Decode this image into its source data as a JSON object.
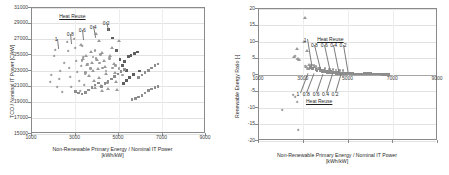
{
  "figure": {
    "panels": [
      "left",
      "right"
    ]
  },
  "chart_data": [
    {
      "id": "tco-chart",
      "type": "scatter",
      "title": "",
      "xlabel": "Non-Renewable Primary Energy / Nominal IT Power [kWh/kW]",
      "xlabel_line1": "Non-Renewable Primary Energy / Nominal IT Power",
      "xlabel_line2": "[kWh/kW]",
      "ylabel": "TCO / Nominal IT Power [C/kW]",
      "xlim": [
        1000,
        9000
      ],
      "ylim": [
        15000,
        31000
      ],
      "xticks": [
        1000,
        3000,
        5000,
        7000,
        9000
      ],
      "yticks": [
        15000,
        17000,
        19000,
        21000,
        23000,
        25000,
        27000,
        29000,
        31000
      ],
      "grid": true,
      "legend": "none",
      "annotations": [
        {
          "text": "Heat Reuse",
          "underline": true,
          "x": 2250,
          "y": 30300
        },
        {
          "text": "1",
          "x": 2050,
          "y": 27300
        },
        {
          "text": "0.8",
          "x": 2600,
          "y": 27900
        },
        {
          "text": "0.6",
          "x": 3150,
          "y": 28400
        },
        {
          "text": "0.4",
          "x": 3650,
          "y": 28900
        },
        {
          "text": "0.2",
          "x": 4250,
          "y": 29400
        }
      ],
      "series": [
        {
          "name": "heat-reuse-1.0",
          "marker": "dia",
          "points": [
            [
              1900,
              22500
            ],
            [
              1850,
              21600
            ],
            [
              2050,
              25700
            ],
            [
              2000,
              24900
            ],
            [
              2150,
              21000
            ],
            [
              2300,
              23000
            ],
            [
              2250,
              21900
            ],
            [
              2400,
              20300
            ],
            [
              2600,
              26600
            ],
            [
              2650,
              25500
            ],
            [
              2700,
              23400
            ],
            [
              2750,
              22200
            ],
            [
              2800,
              20900
            ],
            [
              2500,
              24000
            ]
          ]
        },
        {
          "name": "heat-reuse-0.8",
          "marker": "dia",
          "points": [
            [
              2950,
              27000
            ],
            [
              3000,
              25900
            ],
            [
              3050,
              24200
            ],
            [
              3100,
              22900
            ],
            [
              3150,
              21700
            ],
            [
              3200,
              20400
            ],
            [
              3250,
              23600
            ],
            [
              3300,
              26100
            ],
            [
              3350,
              24700
            ],
            [
              3400,
              21200
            ],
            [
              3450,
              22600
            ]
          ]
        },
        {
          "name": "heat-reuse-0.6",
          "marker": "tri",
          "points": [
            [
              3250,
              26300
            ],
            [
              3350,
              24600
            ],
            [
              3500,
              25000
            ],
            [
              3550,
              23800
            ],
            [
              3600,
              22400
            ],
            [
              3700,
              25400
            ],
            [
              3750,
              24100
            ],
            [
              3800,
              23100
            ],
            [
              3850,
              21800
            ],
            [
              3900,
              20900
            ],
            [
              4000,
              24400
            ],
            [
              4050,
              23300
            ],
            [
              4100,
              22200
            ],
            [
              4150,
              21100
            ],
            [
              4200,
              20500
            ]
          ]
        },
        {
          "name": "heat-reuse-0.4",
          "marker": "tri",
          "points": [
            [
              3950,
              27700
            ],
            [
              4100,
              26800
            ],
            [
              4200,
              25300
            ],
            [
              4300,
              24300
            ],
            [
              4350,
              23500
            ],
            [
              4400,
              22700
            ],
            [
              4450,
              21500
            ],
            [
              4500,
              20800
            ],
            [
              4600,
              24900
            ],
            [
              4700,
              26000
            ],
            [
              4750,
              23900
            ],
            [
              4800,
              22800
            ],
            [
              4850,
              21600
            ],
            [
              4900,
              20600
            ],
            [
              5000,
              26900
            ]
          ]
        },
        {
          "name": "heat-reuse-0.2",
          "marker": "sqd",
          "points": [
            [
              4500,
              28300
            ],
            [
              4700,
              27200
            ],
            [
              4900,
              25600
            ],
            [
              5050,
              24500
            ],
            [
              5150,
              23700
            ],
            [
              5250,
              24200
            ],
            [
              5350,
              23100
            ],
            [
              5450,
              24800
            ],
            [
              5550,
              25000
            ],
            [
              5700,
              25200
            ],
            [
              5850,
              25400
            ],
            [
              5950,
              23000
            ],
            [
              5650,
              22600
            ],
            [
              5500,
              22200
            ],
            [
              5350,
              21800
            ],
            [
              5200,
              21400
            ]
          ]
        },
        {
          "name": "trend-lower-1",
          "marker": "sq",
          "points": [
            [
              3000,
              20400
            ],
            [
              3150,
              20200
            ],
            [
              3300,
              20100
            ],
            [
              3450,
              20300
            ],
            [
              3600,
              20600
            ],
            [
              3750,
              20900
            ],
            [
              3900,
              21200
            ],
            [
              4050,
              21500
            ],
            [
              4200,
              21000
            ],
            [
              4350,
              21400
            ],
            [
              4500,
              21700
            ],
            [
              4650,
              22000
            ],
            [
              4800,
              22300
            ],
            [
              4950,
              22600
            ],
            [
              5100,
              22900
            ],
            [
              5250,
              23200
            ]
          ]
        },
        {
          "name": "trend-lower-2",
          "marker": "sq",
          "points": [
            [
              5600,
              19400
            ],
            [
              5750,
              19500
            ],
            [
              5900,
              19700
            ],
            [
              6050,
              19900
            ],
            [
              6200,
              20200
            ],
            [
              6350,
              20500
            ],
            [
              6500,
              20700
            ],
            [
              6650,
              20900
            ],
            [
              6800,
              21000
            ]
          ]
        },
        {
          "name": "trend-upper-right",
          "marker": "sq",
          "points": [
            [
              5900,
              22200
            ],
            [
              6050,
              22500
            ],
            [
              6200,
              22800
            ],
            [
              6350,
              23100
            ],
            [
              6500,
              23400
            ],
            [
              6650,
              23700
            ],
            [
              6800,
              23900
            ]
          ]
        },
        {
          "name": "mid-scatter",
          "marker": "cir",
          "points": [
            [
              3800,
              24800
            ],
            [
              3950,
              24600
            ],
            [
              4100,
              24000
            ],
            [
              4250,
              23400
            ],
            [
              4400,
              23000
            ],
            [
              3550,
              23900
            ],
            [
              3700,
              23300
            ],
            [
              3450,
              22800
            ],
            [
              3300,
              24300
            ],
            [
              4550,
              24600
            ],
            [
              4150,
              25100
            ],
            [
              3900,
              25600
            ],
            [
              4700,
              23400
            ],
            [
              4850,
              23700
            ],
            [
              5000,
              23300
            ],
            [
              5150,
              22500
            ]
          ]
        }
      ]
    },
    {
      "id": "rer-chart",
      "type": "scatter",
      "title": "",
      "xlabel": "Non-Renewable Primary Energy / Nominal IT Power [kWh/kW]",
      "xlabel_line1": "Non-Renewable Primary Energy / Nominal IT Power",
      "xlabel_line2": "[kWh/kW]",
      "ylabel": "Renewable Energy Ratio [-]",
      "xlim": [
        1000,
        9000
      ],
      "ylim": [
        -20,
        20
      ],
      "xticks": [
        1000,
        3000,
        5000,
        7000,
        9000
      ],
      "yticks": [
        -20,
        -15,
        -10,
        -5,
        0,
        5,
        10,
        15,
        20
      ],
      "grid": true,
      "legend": "none",
      "annotations": [
        {
          "text": "Heat Reuse",
          "underline": true,
          "x": 3600,
          "y": 11.6
        },
        {
          "text": "1",
          "x": 3000,
          "y": 11.2
        },
        {
          "text": "0.8",
          "x": 3320,
          "y": 9.6
        },
        {
          "text": "0.6",
          "x": 3760,
          "y": 9.6
        },
        {
          "text": "0.4",
          "x": 4180,
          "y": 9.6
        },
        {
          "text": "0.2",
          "x": 4600,
          "y": 9.6
        },
        {
          "text": "1",
          "x": 2680,
          "y": -5.2
        },
        {
          "text": "0.8",
          "x": 2960,
          "y": -5.2
        },
        {
          "text": "0.6",
          "x": 3400,
          "y": -5.2
        },
        {
          "text": "0.4",
          "x": 3820,
          "y": -5.2
        },
        {
          "text": "0.2",
          "x": 4240,
          "y": -5.2
        },
        {
          "text": "Heat Reuse",
          "underline": true,
          "x": 3100,
          "y": -7.4
        }
      ],
      "series": [
        {
          "name": "upper-outliers",
          "marker": "tri",
          "points": [
            [
              3050,
              17.3
            ],
            [
              3000,
              10.2
            ],
            [
              3150,
              7.4
            ],
            [
              2550,
              5.6
            ],
            [
              2700,
              8.0
            ],
            [
              2750,
              4.8
            ],
            [
              2800,
              4.6
            ],
            [
              3250,
              3.2
            ],
            [
              3100,
              2.4
            ],
            [
              3200,
              2.0
            ]
          ]
        },
        {
          "name": "upper-outliers-dia",
          "marker": "dia",
          "points": [
            [
              2600,
              5.6
            ],
            [
              2700,
              4.9
            ],
            [
              2800,
              4.6
            ],
            [
              3050,
              2.6
            ],
            [
              3150,
              2.2
            ],
            [
              3250,
              1.9
            ],
            [
              3300,
              2.8
            ]
          ]
        },
        {
          "name": "cluster-band",
          "marker": "sq",
          "points": [
            [
              3300,
              2.2
            ],
            [
              3400,
              1.9
            ],
            [
              3500,
              2.4
            ],
            [
              3550,
              1.6
            ],
            [
              3600,
              1.3
            ],
            [
              3700,
              1.9
            ],
            [
              3750,
              1.2
            ],
            [
              3800,
              1.5
            ],
            [
              3850,
              1.0
            ],
            [
              3900,
              1.3
            ],
            [
              3950,
              0.9
            ],
            [
              4000,
              1.2
            ],
            [
              4050,
              0.8
            ],
            [
              4100,
              1.1
            ],
            [
              4150,
              0.7
            ],
            [
              4200,
              1.0
            ],
            [
              4250,
              0.6
            ],
            [
              4300,
              0.9
            ],
            [
              4350,
              0.6
            ],
            [
              4400,
              0.8
            ],
            [
              4450,
              0.5
            ],
            [
              4500,
              0.7
            ],
            [
              4550,
              0.5
            ],
            [
              4600,
              0.6
            ],
            [
              4650,
              0.5
            ],
            [
              4700,
              0.6
            ],
            [
              4750,
              0.4
            ],
            [
              4800,
              0.5
            ],
            [
              4850,
              0.4
            ],
            [
              4900,
              0.5
            ],
            [
              4950,
              0.4
            ],
            [
              5000,
              0.4
            ]
          ]
        },
        {
          "name": "cluster-upper-dots",
          "marker": "cir",
          "points": [
            [
              3450,
              2.9
            ],
            [
              3550,
              2.5
            ],
            [
              3650,
              2.1
            ],
            [
              4150,
              1.8
            ],
            [
              4300,
              1.6
            ],
            [
              4600,
              1.4
            ],
            [
              4750,
              1.3
            ],
            [
              3950,
              2.0
            ],
            [
              4450,
              1.5
            ],
            [
              3350,
              3.0
            ]
          ]
        },
        {
          "name": "tail-right",
          "marker": "sq",
          "points": [
            [
              5100,
              0.4
            ],
            [
              5200,
              0.4
            ],
            [
              5300,
              0.3
            ],
            [
              5400,
              0.3
            ],
            [
              5500,
              0.3
            ],
            [
              5600,
              0.3
            ],
            [
              5700,
              0.5
            ],
            [
              5800,
              0.5
            ],
            [
              5900,
              0.4
            ],
            [
              6000,
              0.4
            ],
            [
              6100,
              0.3
            ],
            [
              6200,
              0.3
            ],
            [
              6300,
              0.3
            ],
            [
              6400,
              0.3
            ],
            [
              6500,
              0.2
            ],
            [
              6600,
              0.2
            ],
            [
              6700,
              0.2
            ],
            [
              6800,
              0.2
            ]
          ]
        },
        {
          "name": "negative-outliers",
          "marker": "dia",
          "points": [
            [
              2550,
              -6.2
            ],
            [
              2600,
              -6.6
            ],
            [
              2700,
              -8.1
            ],
            [
              2050,
              -10.7
            ],
            [
              2750,
              -16.6
            ]
          ]
        }
      ]
    }
  ]
}
